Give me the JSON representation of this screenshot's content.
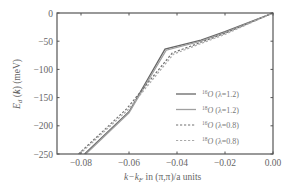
{
  "chart_data": {
    "type": "line",
    "title": "",
    "xlabel": "k−k_F in (π,π)/a units",
    "ylabel": "E_d (k) (meV)",
    "xlim": [
      -0.09,
      0.0
    ],
    "ylim": [
      -250,
      0
    ],
    "grid": false,
    "legend_position": "lower right, inside",
    "x_ticks": [
      -0.08,
      -0.06,
      -0.04,
      -0.02,
      0.0
    ],
    "x_tick_labels": [
      "−0.08",
      "−0.06",
      "−0.04",
      "−0.02",
      "0.00"
    ],
    "y_ticks": [
      0,
      -50,
      -100,
      -150,
      -200,
      -250
    ],
    "y_tick_labels": [
      "0",
      "−50",
      "−100",
      "−150",
      "−200",
      "−250"
    ],
    "series": [
      {
        "name": "16O (λ=1.2)",
        "isotope": "16",
        "label": "O (λ=1.2)",
        "style": "solid",
        "color": "#666666",
        "points": [
          [
            -0.0785,
            -250
          ],
          [
            -0.06,
            -175
          ],
          [
            -0.045,
            -64
          ],
          [
            -0.03,
            -48
          ],
          [
            -0.02,
            -33
          ],
          [
            0.0,
            0
          ]
        ]
      },
      {
        "name": "18O (λ=1.2)",
        "isotope": "18",
        "label": "O (λ=1.2)",
        "style": "solid",
        "color": "#a0a0a0",
        "points": [
          [
            -0.078,
            -250
          ],
          [
            -0.06,
            -177
          ],
          [
            -0.0445,
            -66
          ],
          [
            -0.03,
            -50
          ],
          [
            -0.02,
            -35
          ],
          [
            0.0,
            0
          ]
        ]
      },
      {
        "name": "16O (λ=0.8)",
        "isotope": "16",
        "label": "O (λ=0.8)",
        "style": "dashed",
        "color": "#707070",
        "points": [
          [
            -0.081,
            -250
          ],
          [
            -0.061,
            -170
          ],
          [
            -0.042,
            -71
          ],
          [
            -0.03,
            -52
          ],
          [
            -0.02,
            -36
          ],
          [
            0.0,
            0
          ]
        ]
      },
      {
        "name": "18O (λ=0.8)",
        "isotope": "18",
        "label": "O (λ=0.8)",
        "style": "dashed",
        "color": "#aaaaaa",
        "points": [
          [
            -0.0805,
            -250
          ],
          [
            -0.0605,
            -172
          ],
          [
            -0.0415,
            -73
          ],
          [
            -0.03,
            -54
          ],
          [
            -0.02,
            -38
          ],
          [
            0.0,
            0
          ]
        ]
      }
    ]
  }
}
